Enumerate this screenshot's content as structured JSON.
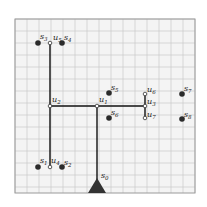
{
  "diagram": {
    "type": "steiner-tree-on-grid",
    "grid": {
      "x0": 15,
      "y0": 19,
      "x1": 195,
      "y1": 193,
      "cell": 12,
      "line_color": "#c8c8c8",
      "bg": "#f4f4f4",
      "border_color": "#9a9a9a"
    },
    "colors": {
      "edge": "#111111",
      "sink": "#2b2b2b",
      "steiner_fill": "#ffffff",
      "steiner_stroke": "#333333",
      "source": "#333333"
    },
    "source": {
      "id": "s0",
      "label": "s",
      "sub": "0",
      "x": 97,
      "y": 193,
      "label_x": 101,
      "label_y": 178
    },
    "steiner_nodes": [
      {
        "id": "u1",
        "label": "u",
        "sub": "1",
        "x": 97,
        "y": 106,
        "label_x": 99,
        "label_y": 102
      },
      {
        "id": "u2",
        "label": "u",
        "sub": "2",
        "x": 50,
        "y": 106,
        "label_x": 52,
        "label_y": 102
      },
      {
        "id": "u3",
        "label": "u",
        "sub": "3",
        "x": 145,
        "y": 106,
        "label_x": 147,
        "label_y": 104
      },
      {
        "id": "u4",
        "label": "u",
        "sub": "4",
        "x": 50,
        "y": 167,
        "label_x": 51,
        "label_y": 163
      },
      {
        "id": "u5",
        "label": "u",
        "sub": "5",
        "x": 50,
        "y": 43,
        "label_x": 53,
        "label_y": 40
      },
      {
        "id": "u6",
        "label": "u",
        "sub": "6",
        "x": 145,
        "y": 94,
        "label_x": 147,
        "label_y": 92
      },
      {
        "id": "u7",
        "label": "u",
        "sub": "7",
        "x": 145,
        "y": 118,
        "label_x": 147,
        "label_y": 117
      }
    ],
    "sinks": [
      {
        "id": "s1",
        "label": "s",
        "sub": "1",
        "x": 38,
        "y": 167,
        "label_x": 40,
        "label_y": 163
      },
      {
        "id": "s2",
        "label": "s",
        "sub": "2",
        "x": 62,
        "y": 167,
        "label_x": 64,
        "label_y": 165
      },
      {
        "id": "s3",
        "label": "s",
        "sub": "3",
        "x": 38,
        "y": 43,
        "label_x": 40,
        "label_y": 39
      },
      {
        "id": "s4",
        "label": "s",
        "sub": "4",
        "x": 62,
        "y": 43,
        "label_x": 64,
        "label_y": 40
      },
      {
        "id": "s5",
        "label": "s",
        "sub": "5",
        "x": 109,
        "y": 93,
        "label_x": 111,
        "label_y": 90
      },
      {
        "id": "s6",
        "label": "s",
        "sub": "6",
        "x": 109,
        "y": 118,
        "label_x": 111,
        "label_y": 115
      },
      {
        "id": "s7",
        "label": "s",
        "sub": "7",
        "x": 182,
        "y": 94,
        "label_x": 184,
        "label_y": 91
      },
      {
        "id": "s8",
        "label": "s",
        "sub": "8",
        "x": 182,
        "y": 119,
        "label_x": 184,
        "label_y": 117
      }
    ],
    "edges": [
      {
        "from": "u5",
        "to": "u4",
        "x1": 50,
        "y1": 43,
        "x2": 50,
        "y2": 167
      },
      {
        "from": "u2",
        "to": "u3",
        "x1": 50,
        "y1": 106,
        "x2": 145,
        "y2": 106
      },
      {
        "from": "u1",
        "to": "s0",
        "x1": 97,
        "y1": 106,
        "x2": 97,
        "y2": 185
      },
      {
        "from": "u6",
        "to": "u7",
        "x1": 145,
        "y1": 94,
        "x2": 145,
        "y2": 118
      }
    ]
  }
}
